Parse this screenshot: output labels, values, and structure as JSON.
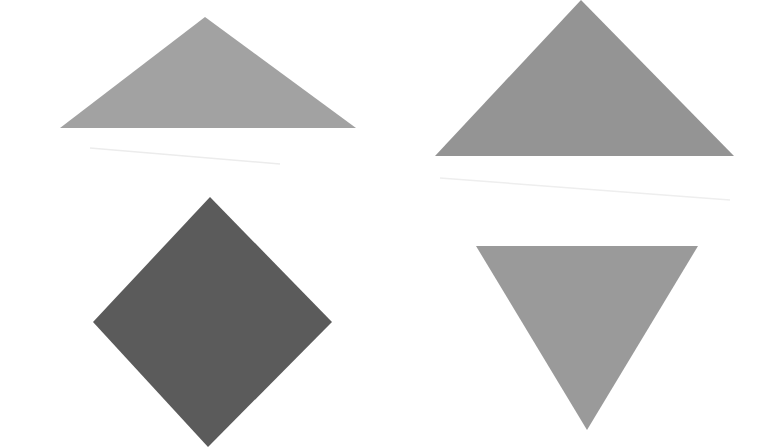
{
  "figure": {
    "background": "#ffffff",
    "shapes": [
      {
        "id": "shape-1",
        "name": "triangle-up-wide",
        "kind": "triangle",
        "orientation": "up",
        "points": "60,128 205,17 356,128",
        "fill": "#a2a2a2"
      },
      {
        "id": "shape-2",
        "name": "triangle-up-large",
        "kind": "triangle",
        "orientation": "up",
        "points": "435,156 581,0 734,156",
        "fill": "#949494"
      },
      {
        "id": "shape-3",
        "name": "diamond",
        "kind": "diamond",
        "orientation": "rotated-square",
        "points": "210,197 332,322 208,447 93,322",
        "fill": "#5b5b5b"
      },
      {
        "id": "shape-4",
        "name": "triangle-down",
        "kind": "triangle",
        "orientation": "down",
        "points": "476,246 698,246 587,430",
        "fill": "#9a9a9a"
      }
    ],
    "artifacts": [
      {
        "x1": 90,
        "y1": 148,
        "x2": 280,
        "y2": 164,
        "stroke": "#ececec"
      },
      {
        "x1": 440,
        "y1": 178,
        "x2": 730,
        "y2": 200,
        "stroke": "#eeeeee"
      }
    ]
  }
}
